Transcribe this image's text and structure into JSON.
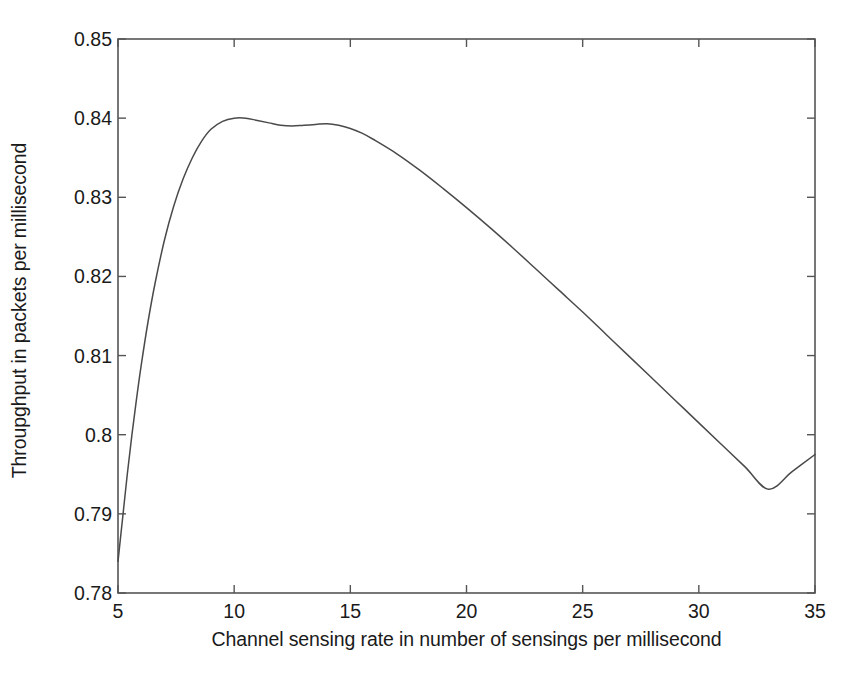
{
  "chart_data": {
    "type": "line",
    "title": "",
    "xlabel": "Channel sensing rate in number of sensings per millisecond",
    "ylabel": "Throupghput in packets per millisecond",
    "xlim": [
      5,
      35
    ],
    "ylim": [
      0.78,
      0.85
    ],
    "xticks": [
      5,
      10,
      15,
      20,
      25,
      30,
      35
    ],
    "xtick_labels": [
      "5",
      "10",
      "15",
      "20",
      "25",
      "30",
      "35"
    ],
    "yticks": [
      0.78,
      0.79,
      0.8,
      0.81,
      0.82,
      0.83,
      0.84,
      0.85
    ],
    "ytick_labels": [
      "0.78",
      "0.79",
      "0.8",
      "0.81",
      "0.82",
      "0.83",
      "0.84",
      "0.85"
    ],
    "grid": false,
    "legend": null,
    "line_color": "#4a4a4a",
    "line_width": 1.5,
    "axis_color": "#555555",
    "background": "#ffffff",
    "series": [
      {
        "name": "throughput",
        "x": [
          5.0,
          5.2,
          5.4,
          5.6,
          5.8,
          6.0,
          6.3,
          6.6,
          7.0,
          7.4,
          7.8,
          8.2,
          8.6,
          9.0,
          9.5,
          10.0,
          10.5,
          11.0,
          11.5,
          12.0,
          12.5,
          13.0,
          13.5,
          14.0,
          14.5,
          15.0,
          15.5,
          16.0,
          17.0,
          18.0,
          19.0,
          20.0,
          21.0,
          22.0,
          23.0,
          24.0,
          25.0,
          26.0,
          27.0,
          28.0,
          29.0,
          30.0,
          31.0,
          32.0,
          33.0,
          34.0,
          35.0
        ],
        "y": [
          0.784,
          0.7895,
          0.795,
          0.8,
          0.8046,
          0.8088,
          0.8144,
          0.8192,
          0.8246,
          0.8289,
          0.8323,
          0.835,
          0.8371,
          0.8386,
          0.8396,
          0.84,
          0.84,
          0.8397,
          0.8394,
          0.8391,
          0.839,
          0.8391,
          0.8392,
          0.8393,
          0.8391,
          0.8387,
          0.8381,
          0.8373,
          0.8355,
          0.8334,
          0.8311,
          0.8287,
          0.8262,
          0.8236,
          0.8209,
          0.8182,
          0.8155,
          0.8127,
          0.8099,
          0.8071,
          0.8043,
          0.8015,
          0.7987,
          0.7959,
          0.7931,
          0.7953,
          0.7975
        ]
      }
    ],
    "annotations": {
      "peak_x": 14.0,
      "peak_y": 0.8393,
      "start_x": 5.0,
      "start_y": 0.784,
      "end_x": 35.0,
      "end_y": 0.7975
    }
  }
}
